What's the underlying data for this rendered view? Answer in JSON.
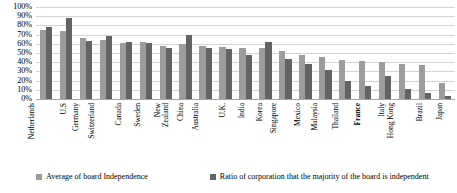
{
  "chart_data": {
    "type": "bar",
    "title": "",
    "xlabel": "",
    "ylabel": "",
    "ylim": [
      0,
      100
    ],
    "ytick_labels": [
      "100%",
      "90%",
      "80%",
      "70%",
      "60%",
      "50%",
      "40%",
      "30%",
      "20%",
      "10%",
      "0%"
    ],
    "ytick_values": [
      100,
      90,
      80,
      70,
      60,
      50,
      40,
      30,
      20,
      10,
      0
    ],
    "grid": true,
    "legend_position": "bottom",
    "categories": [
      "Netherlands",
      "U.S",
      "Germany",
      "Switzerland",
      "Canada",
      "Sweden",
      "New Zealand",
      "China",
      "Australia",
      "U.K.",
      "India",
      "Korea",
      "Singapore",
      "Mexico",
      "Malaysia",
      "Thailand",
      "France",
      "Italy",
      "Hong Kong",
      "Brazil",
      "Japan"
    ],
    "series": [
      {
        "name": "Average of board Independence",
        "color": "#9c9c9c",
        "values": [
          75,
          74,
          66,
          64,
          61,
          62,
          58,
          60,
          58,
          56,
          55,
          55,
          52,
          48,
          46,
          42,
          41,
          40,
          38,
          37,
          17
        ]
      },
      {
        "name": "Ratio of corporation that the majority of the board is independent",
        "color": "#636363",
        "values": [
          78,
          88,
          63,
          68,
          62,
          61,
          55,
          70,
          55,
          54,
          48,
          62,
          43,
          38,
          32,
          20,
          14,
          25,
          11,
          7,
          3
        ]
      }
    ]
  },
  "legend": {
    "items": [
      {
        "label": "Average of board Independence",
        "color": "#9c9c9c"
      },
      {
        "label": "Ratio of corporation that the majority of the board is independent",
        "color": "#636363"
      }
    ]
  }
}
